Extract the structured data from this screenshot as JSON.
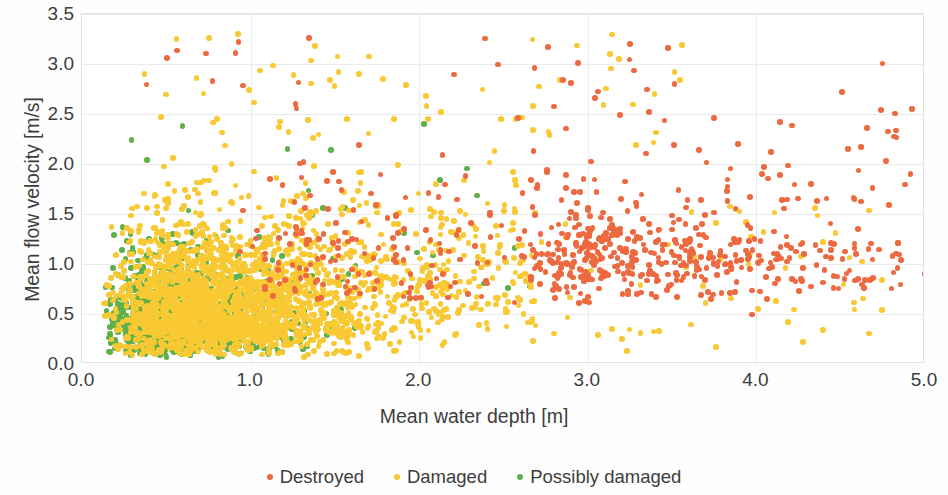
{
  "chart_data": {
    "type": "scatter",
    "title": "",
    "xlabel": "Mean water depth [m]",
    "ylabel": "Mean flow velocity [m/s]",
    "xlim": [
      0.0,
      5.0
    ],
    "ylim": [
      0.0,
      3.5
    ],
    "xticks": [
      "0.0",
      "1.0",
      "2.0",
      "3.0",
      "4.0",
      "5.0"
    ],
    "xtick_values": [
      0.0,
      1.0,
      2.0,
      3.0,
      4.0,
      5.0
    ],
    "yticks": [
      "0.0",
      "0.5",
      "1.0",
      "1.5",
      "2.0",
      "2.5",
      "3.0",
      "3.5"
    ],
    "ytick_values": [
      0.0,
      0.5,
      1.0,
      1.5,
      2.0,
      2.5,
      3.0,
      3.5
    ],
    "grid": "both-faint",
    "legend_position": "bottom-center",
    "marker": "circle",
    "marker_size_px": 5.6,
    "colors": {
      "destroyed": "#ED6A41",
      "damaged": "#F9C933",
      "possibly_damaged": "#5FB04C",
      "grid": "#eaeaea",
      "axis": "#dcdcdc",
      "text": "#3d3d3d",
      "background": "#ffffff"
    },
    "series": [
      {
        "name": "Destroyed",
        "color": "#ED6A41",
        "marker": "circle",
        "description": "Concentrated at large mean water depth (2.5-5.0 m) with mean flow velocity mostly 0.6-1.6 m/s; scattered outliers up to 3.3 m/s at shallow depths.",
        "approx_count": 520
      },
      {
        "name": "Damaged",
        "color": "#F9C933",
        "marker": "circle",
        "description": "Dense broad cloud spanning 0.1-2.5 m depth and 0.0-2.0 m/s velocity, thinning toward greater depths; sparse outliers up to 3.4 m/s.",
        "approx_count": 2600
      },
      {
        "name": "Possibly damaged",
        "color": "#5FB04C",
        "marker": "circle",
        "description": "Tight cluster at shallow depth (0.1-1.8 m) and low velocity (0.0-1.2 m/s), mostly hidden under the damaged cloud.",
        "approx_count": 1100
      }
    ]
  },
  "axes": {
    "ylabel": "Mean flow velocity [m/s]",
    "xlabel": "Mean water depth [m]"
  },
  "legend": {
    "items": [
      {
        "label": "Destroyed",
        "color": "#ED6A41",
        "icon": "dot-marker-icon"
      },
      {
        "label": "Damaged",
        "color": "#F9C933",
        "icon": "dot-marker-icon"
      },
      {
        "label": "Possibly damaged",
        "color": "#5FB04C",
        "icon": "dot-marker-icon"
      }
    ]
  }
}
